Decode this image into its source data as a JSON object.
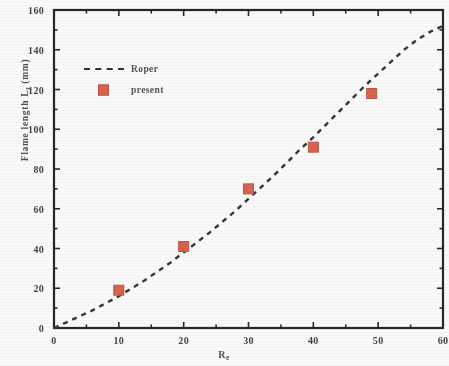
{
  "chart_data": {
    "type": "scatter",
    "title": "",
    "xlabel": "Re",
    "ylabel": "Flame length Lf (mm)",
    "ylabel_main": "Flame length L",
    "ylabel_sub": "f",
    "ylabel_unit": " (mm)",
    "xlabel_main": "R",
    "xlabel_sub": "e",
    "xlim": [
      0,
      60
    ],
    "ylim": [
      0,
      160
    ],
    "xticks": [
      0,
      10,
      20,
      30,
      40,
      50,
      60
    ],
    "xticklabels": [
      "0",
      "10",
      "20",
      "30",
      "40",
      "50",
      "60"
    ],
    "yticks": [
      0,
      20,
      40,
      60,
      80,
      100,
      120,
      140,
      160
    ],
    "yticklabels": [
      "0",
      "20",
      "40",
      "60",
      "80",
      "100",
      "120",
      "140",
      "160"
    ],
    "minor_tick_step_x": 5,
    "minor_tick_step_y": 10,
    "grid": false,
    "legend_position": "upper left",
    "series": [
      {
        "name": "Roper",
        "style": "dashed-line",
        "color": "#2e2e2e",
        "x": [
          0,
          2,
          4,
          6,
          8,
          10,
          12,
          14,
          16,
          18,
          20,
          22,
          24,
          26,
          28,
          30,
          32,
          34,
          36,
          38,
          40,
          42,
          44,
          46,
          48,
          50,
          52,
          54,
          56,
          58,
          60
        ],
        "y": [
          0,
          3,
          6,
          9,
          12.5,
          16,
          20,
          24,
          28.5,
          33,
          38,
          43,
          48,
          53.5,
          59,
          65,
          71,
          77,
          83.5,
          90,
          96,
          102.5,
          109,
          115.5,
          122,
          128,
          134,
          140,
          145,
          149,
          152
        ]
      },
      {
        "name": "present",
        "style": "square-marker",
        "color": "#d9604a",
        "x": [
          10,
          20,
          30,
          40,
          49
        ],
        "y": [
          19,
          41,
          70,
          91,
          118
        ]
      }
    ]
  },
  "legend": {
    "entries": [
      {
        "label": "Roper",
        "key": "dashed-line"
      },
      {
        "label": "present",
        "key": "red-square"
      }
    ]
  },
  "colors": {
    "marker": "#d9604a",
    "marker_edge": "#bf4f3a",
    "line": "#2e2e2e",
    "axis": "#1f1f1f",
    "text": "#3c3c3c"
  }
}
